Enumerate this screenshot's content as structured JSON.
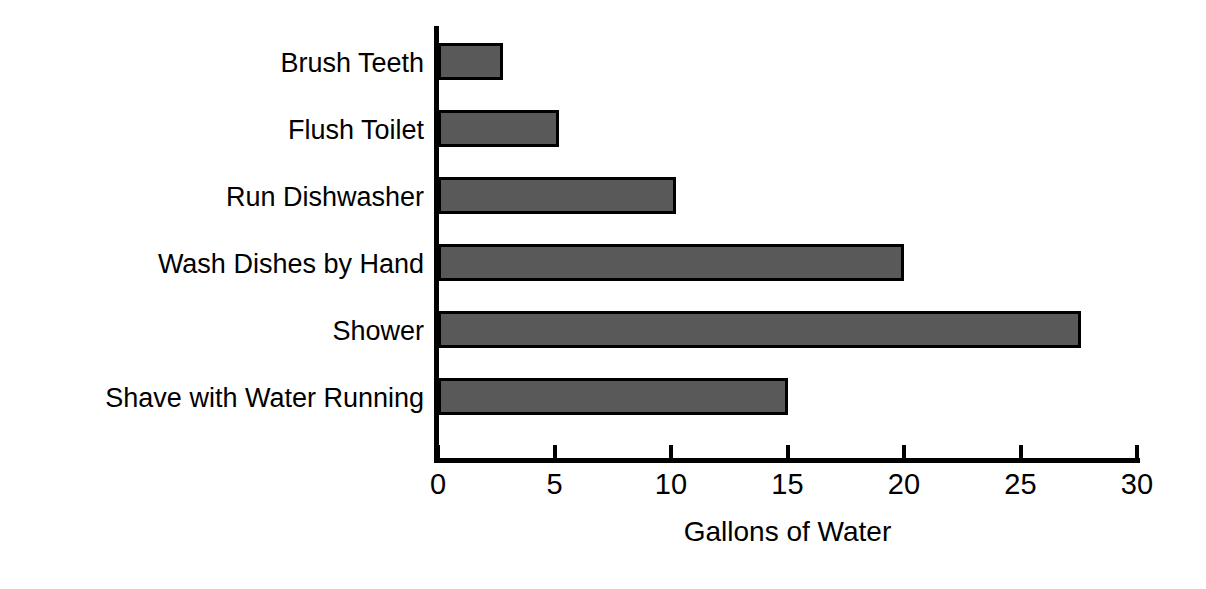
{
  "chart_data": {
    "type": "bar",
    "orientation": "horizontal",
    "title": "",
    "xlabel": "Gallons of Water",
    "ylabel": "",
    "categories": [
      "Brush Teeth",
      "Flush Toilet",
      "Run Dishwasher",
      "Wash Dishes by Hand",
      "Shower",
      "Shave with Water Running"
    ],
    "values": [
      2.8,
      5.2,
      10.2,
      20.0,
      27.6,
      15.0
    ],
    "xlim": [
      0,
      30
    ],
    "xticks": [
      0,
      5,
      10,
      15,
      20,
      25,
      30
    ],
    "xtick_labels": [
      "0",
      "5",
      "10",
      "15",
      "20",
      "25",
      "30"
    ],
    "grid": false,
    "legend": false,
    "bar_fill_color": "#595959",
    "bar_edge_color": "#000000",
    "axis_color": "#000000",
    "background_color": "#ffffff"
  }
}
